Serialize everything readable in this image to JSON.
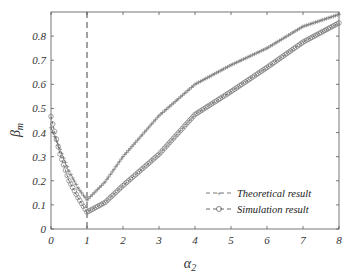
{
  "chart_data": {
    "type": "line",
    "title": "",
    "xlabel": "α2",
    "ylabel": "βm",
    "xlim": [
      0,
      8
    ],
    "ylim": [
      0,
      0.9
    ],
    "xticks": [
      0,
      1,
      2,
      3,
      4,
      5,
      6,
      7,
      8
    ],
    "yticks": [
      0,
      0.1,
      0.2,
      0.3,
      0.4,
      0.5,
      0.6,
      0.7,
      0.8
    ],
    "xtick_labels": [
      "0",
      "1",
      "2",
      "3",
      "4",
      "5",
      "6",
      "7",
      "8"
    ],
    "ytick_labels": [
      "0",
      "0.1",
      "0.2",
      "0.3",
      "0.4",
      "0.5",
      "0.6",
      "0.7",
      "0.8"
    ],
    "grid": false,
    "legend_position": "lower right",
    "annotations": [
      {
        "type": "vertical-dashed-line",
        "x": 1
      }
    ],
    "series": [
      {
        "name": "Theoretical result",
        "marker": "+",
        "line_style": "dashed",
        "color": "#7a7a7a",
        "x": [
          0,
          0.25,
          0.5,
          0.75,
          1,
          1.5,
          2,
          3,
          4,
          5,
          6,
          7,
          8
        ],
        "y": [
          0.42,
          0.33,
          0.24,
          0.17,
          0.12,
          0.195,
          0.3,
          0.47,
          0.6,
          0.68,
          0.75,
          0.84,
          0.89
        ]
      },
      {
        "name": "Simulation result",
        "marker": "o",
        "line_style": "dashed",
        "color": "#6a6a6a",
        "x": [
          0,
          0.25,
          0.5,
          0.75,
          1,
          1.5,
          2,
          3,
          4,
          5,
          6,
          7,
          8
        ],
        "y": [
          0.467,
          0.31,
          0.2,
          0.13,
          0.07,
          0.11,
          0.18,
          0.31,
          0.475,
          0.57,
          0.67,
          0.775,
          0.855
        ]
      }
    ]
  },
  "axes": {
    "xlabel_main": "α",
    "xlabel_sub": "2",
    "ylabel_main": "β",
    "ylabel_sub": "m"
  },
  "legend": {
    "items": [
      {
        "label": "Theoretical result",
        "marker": "+"
      },
      {
        "label": "Simulation result",
        "marker": "o"
      }
    ]
  }
}
